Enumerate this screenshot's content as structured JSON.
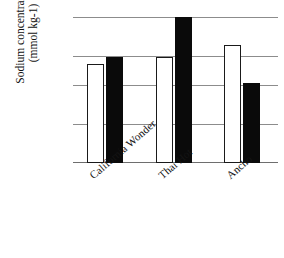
{
  "chart_data": {
    "type": "bar",
    "title": "",
    "xlabel": "",
    "ylabel": "Sodium concentration (mmol kg-1)",
    "ylabel_line1": "Sodium concentration",
    "ylabel_line2": "(mmol kg-1)",
    "categories": [
      "California Wonder",
      "Thai Hot",
      "Ancho"
    ],
    "series": [
      {
        "name": "open",
        "fill": "#ffffff",
        "values": [
          10.2,
          10.9,
          12.1
        ]
      },
      {
        "name": "solid",
        "fill": "#0a0a0a",
        "values": [
          10.9,
          15.0,
          8.2
        ]
      }
    ],
    "ylim": [
      0,
      15
    ],
    "yticks": [
      0,
      4,
      8,
      11,
      15
    ],
    "ytick_labels": [
      "0",
      "4",
      "8",
      "11",
      "15"
    ],
    "grid": true,
    "grid_color": "#8c8c8c",
    "legend": "none"
  }
}
